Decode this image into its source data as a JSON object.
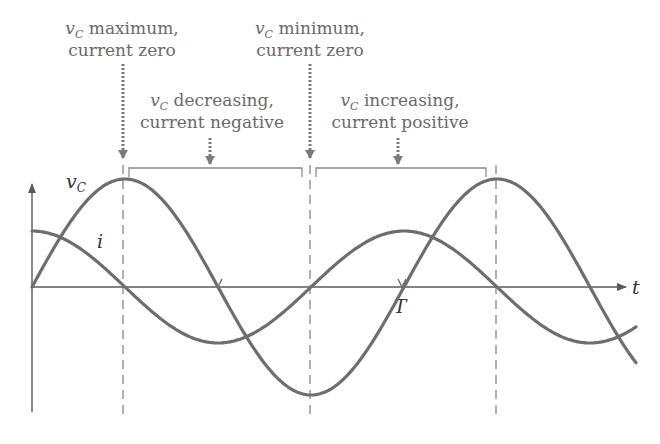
{
  "diagram": {
    "annotations": [
      {
        "id": "vc-max",
        "symbol": "v",
        "subscript": "C",
        "line1_rest": " maximum,",
        "line2": "current zero"
      },
      {
        "id": "vc-min",
        "symbol": "v",
        "subscript": "C",
        "line1_rest": " minimum,",
        "line2": "current zero"
      },
      {
        "id": "vc-dec",
        "symbol": "v",
        "subscript": "C",
        "line1_rest": " decreasing,",
        "line2": "current negative"
      },
      {
        "id": "vc-inc",
        "symbol": "v",
        "subscript": "C",
        "line1_rest": " increasing,",
        "line2": "current positive"
      }
    ],
    "axis": {
      "x_label": "t",
      "period_label": "T"
    },
    "curves": [
      {
        "name": "vC",
        "symbol": "v",
        "subscript": "C",
        "shape": "sine",
        "color": "#6e6e6e"
      },
      {
        "name": "i",
        "symbol": "i",
        "shape": "cosine",
        "color": "#6e6e6e"
      }
    ],
    "colors": {
      "text": "#6a6a6a",
      "curve": "#6e6e6e",
      "axis": "#5a5a5a"
    }
  }
}
